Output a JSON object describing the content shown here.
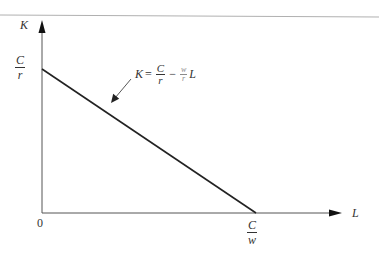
{
  "diagram": {
    "type": "isocost-line",
    "colors": {
      "axis": "#555555",
      "line": "#222222",
      "top_rule": "#b0b0b0",
      "text": "#333333"
    },
    "y_axis": {
      "label": "K"
    },
    "x_axis": {
      "label": "L"
    },
    "origin_label": "0",
    "y_intercept": {
      "numerator": "C",
      "denominator": "r"
    },
    "x_intercept": {
      "numerator": "C",
      "denominator": "w"
    },
    "equation": {
      "lhs": "K",
      "equals": "=",
      "term1_num": "C",
      "term1_den": "r",
      "minus": "−",
      "term2_num": "w",
      "term2_den": "r",
      "variable": "L"
    }
  }
}
